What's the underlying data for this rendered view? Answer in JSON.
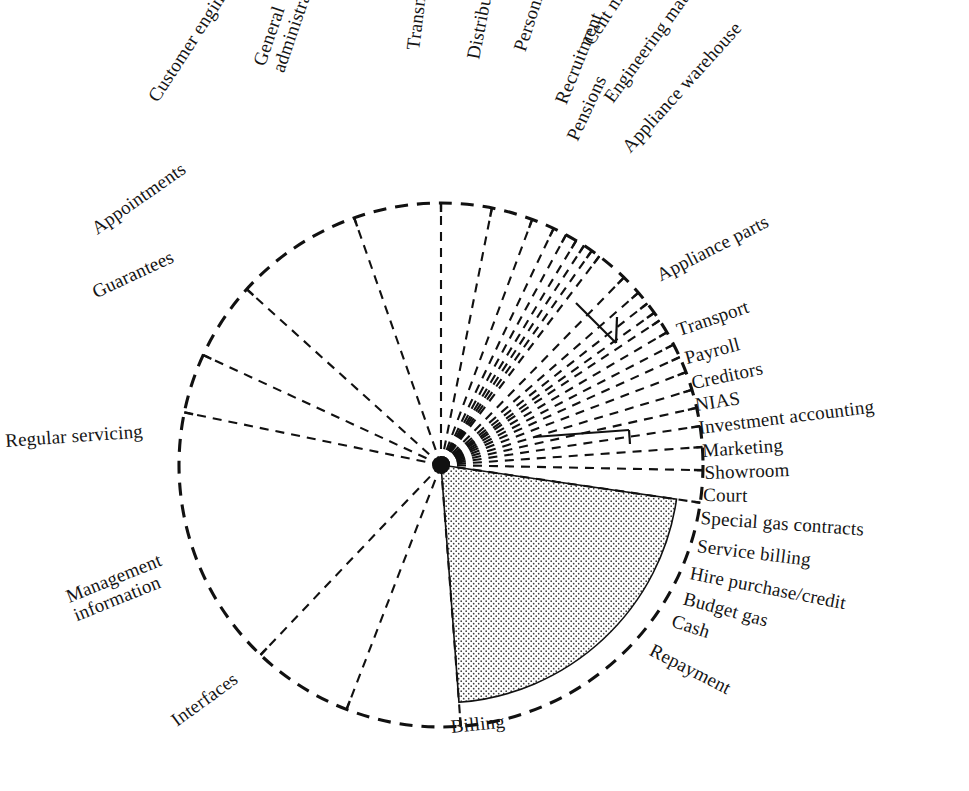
{
  "chart_data": {
    "type": "pie",
    "title": "",
    "subtitle": "",
    "xlabel": "",
    "ylabel": "",
    "legend_position": "labels-around-perimeter",
    "grid": false,
    "units": "degrees of arc",
    "total_degrees": 360,
    "highlight": "Billing",
    "categories": [
      "Transmission",
      "Distribution",
      "Personnel records",
      "Recruitment",
      "Pensions",
      "Cent mat. and stat. stores",
      "Engineering materials",
      "Appliance warehouse",
      "Appliance parts",
      "Transport",
      "Payroll",
      "Creditors",
      "NIAS",
      "Investment accounting",
      "Marketing",
      "Showroom",
      "Court",
      "Special gas contracts",
      "Service billing",
      "Hire purchase/credit",
      "Budget gas",
      "Cash",
      "Repayment",
      "Billing",
      "Interfaces",
      "Management information",
      "Regular servicing",
      "Guarantees",
      "Appointments",
      "Customer engineers",
      "General administrators"
    ],
    "values": [
      11.0,
      9.0,
      5.0,
      3.0,
      2.5,
      2.0,
      2.0,
      2.0,
      7.0,
      4.5,
      3.0,
      2.5,
      2.0,
      3.0,
      3.0,
      3.0,
      3.5,
      4.0,
      4.0,
      4.0,
      4.5,
      5.0,
      7.0,
      76.0,
      25.0,
      22.0,
      57.0,
      13.0,
      17.0,
      28.0,
      19.0
    ],
    "sector_sequence_clockwise_from_12oclock": [
      "Transmission",
      "Distribution",
      "Personnel records",
      "Recruitment",
      "Pensions",
      "Cent mat. and stat. stores",
      "Engineering materials",
      "Appliance warehouse",
      "Appliance parts",
      "Transport",
      "Payroll",
      "Creditors",
      "NIAS",
      "Investment accounting",
      "Marketing",
      "Showroom",
      "Court",
      "Special gas contracts",
      "Service billing",
      "Hire purchase/credit",
      "Budget gas",
      "Cash",
      "Repayment",
      "Billing",
      "Interfaces",
      "Management information",
      "Regular servicing",
      "Guarantees",
      "Appointments",
      "Customer engineers",
      "General administrators"
    ]
  },
  "labels": {
    "transmission": "Transmission",
    "distribution": "Distribution",
    "personnel_records": "Personnel records",
    "recruitment": "Recruitment",
    "pensions": "Pensions",
    "cent_mat": "Cent mat. and stat. stores",
    "engineering_materials": "Engineering materials",
    "appliance_warehouse": "Appliance warehouse",
    "appliance_parts": "Appliance parts",
    "transport": "Transport",
    "payroll": "Payroll",
    "creditors": "Creditors",
    "nias": "NIAS",
    "investment_accounting": "Investment accounting",
    "marketing": "Marketing",
    "showroom": "Showroom",
    "court": "Court",
    "special_gas_contracts": "Special gas contracts",
    "service_billing": "Service billing",
    "hire_purchase_credit": "Hire purchase/credit",
    "budget_gas": "Budget gas",
    "cash": "Cash",
    "repayment": "Repayment",
    "billing": "Billing",
    "interfaces": "Interfaces",
    "management_information": "Management\ninformation",
    "regular_servicing": "Regular servicing",
    "guarantees": "Guarantees",
    "appointments": "Appointments",
    "customer_engineers": "Customer engineers",
    "general_administrators": "General\nadministrators"
  },
  "style": {
    "ink": "#111111",
    "paper": "#ffffff",
    "stipple": "#4a4a4a",
    "highlight_fill": "#f2f2f2"
  },
  "geometry": {
    "center_x": 441,
    "center_y": 465,
    "outer_radius": 262,
    "billing_arc_radius": 238
  }
}
